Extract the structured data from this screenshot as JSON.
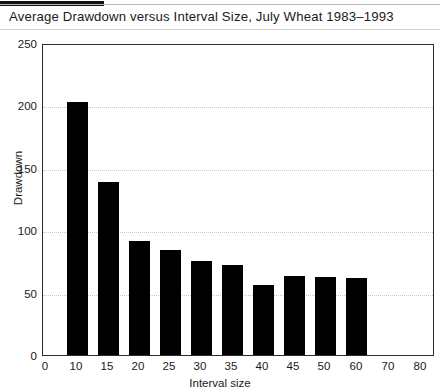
{
  "chart_data": {
    "type": "bar",
    "title": "Average Drawdown versus Interval Size, July Wheat 1983–1993",
    "xlabel": "Interval size",
    "ylabel": "Drawdown",
    "categories": [
      "5",
      "10",
      "15",
      "20",
      "25",
      "30",
      "35",
      "40",
      "45",
      "50"
    ],
    "values": [
      205,
      140,
      92,
      85,
      76,
      73,
      57,
      64,
      63,
      0
    ],
    "bars": [
      {
        "interval": "5",
        "value": 205
      },
      {
        "interval": "10",
        "value": 140
      },
      {
        "interval": "15",
        "value": 92
      },
      {
        "interval": "20",
        "value": 85
      },
      {
        "interval": "25",
        "value": 76
      },
      {
        "interval": "30",
        "value": 73
      },
      {
        "interval": "35",
        "value": 57
      },
      {
        "interval": "40",
        "value": 64
      },
      {
        "interval": "45",
        "value": 63
      },
      {
        "interval": "50",
        "value": 62
      }
    ],
    "xtick_labels": [
      "0",
      "10",
      "15",
      "20",
      "25",
      "30",
      "35",
      "40",
      "45",
      "50",
      "60",
      "70",
      "80"
    ],
    "ytick_labels": [
      "0",
      "50",
      "100",
      "150",
      "200",
      "250"
    ],
    "ylim": [
      0,
      250
    ],
    "grid": "horizontal-dotted",
    "legend": "none",
    "bar_color": "#000000",
    "frame_color": "#2b2b2b",
    "grid_color": "#c9c9c9",
    "background": "#ffffff"
  }
}
